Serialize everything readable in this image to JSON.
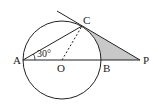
{
  "diagram": {
    "type": "geometry",
    "points": {
      "A": {
        "label": "A",
        "x": 23,
        "y": 60
      },
      "O": {
        "label": "O",
        "x": 62,
        "y": 60
      },
      "B": {
        "label": "B",
        "x": 101,
        "y": 60
      },
      "C": {
        "label": "C",
        "x": 82,
        "y": 26
      },
      "P": {
        "label": "P",
        "x": 140,
        "y": 60
      }
    },
    "circle": {
      "center": "O",
      "radius": 39
    },
    "angle_label": "30°",
    "angle_at": "A",
    "segments": [
      "AC",
      "AP",
      "CP (tangent)",
      "OC (dashed)"
    ],
    "shaded_region": "region bounded by arc BC, CP and BP",
    "colors": {
      "stroke": "#222222",
      "shade": "#c8c8c8"
    }
  }
}
